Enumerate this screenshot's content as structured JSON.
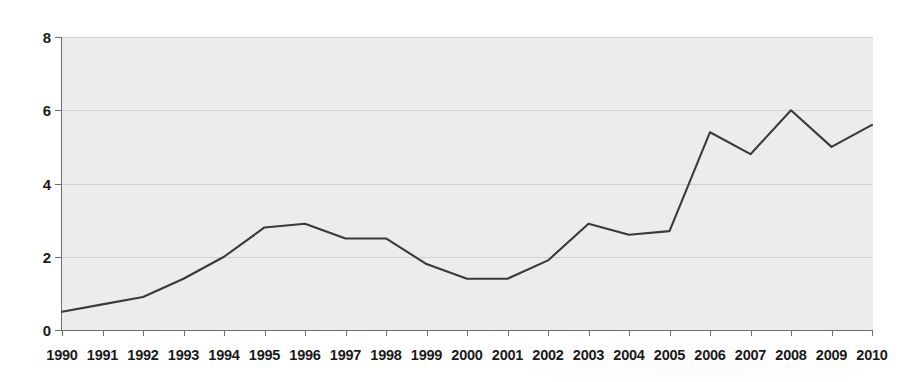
{
  "chart_data": {
    "type": "line",
    "title": "",
    "subtitle": "",
    "xlabel": "",
    "ylabel": "",
    "categories": [
      "1990",
      "1991",
      "1992",
      "1993",
      "1994",
      "1995",
      "1996",
      "1997",
      "1998",
      "1999",
      "2000",
      "2001",
      "2002",
      "2003",
      "2004",
      "2005",
      "2006",
      "2007",
      "2008",
      "2009",
      "2010"
    ],
    "values": [
      0.5,
      0.7,
      0.9,
      1.4,
      2.0,
      2.8,
      2.9,
      2.5,
      2.5,
      1.8,
      1.4,
      1.4,
      1.9,
      2.9,
      2.6,
      2.7,
      5.4,
      4.8,
      6.0,
      5.0,
      5.6
    ],
    "series": [
      {
        "name": "",
        "values": [
          0.5,
          0.7,
          0.9,
          1.4,
          2.0,
          2.8,
          2.9,
          2.5,
          2.5,
          1.8,
          1.4,
          1.4,
          1.9,
          2.9,
          2.6,
          2.7,
          5.4,
          4.8,
          6.0,
          5.0,
          5.6
        ]
      }
    ],
    "ylim": [
      0,
      8
    ],
    "y_ticks": [
      "0",
      "2",
      "4",
      "6",
      "8"
    ],
    "y_tick_values": [
      0,
      2,
      4,
      6,
      8
    ],
    "grid": true,
    "grid_axis": "y",
    "legend": "none",
    "line_color": "#3a3a3a",
    "plot_background": "#ececec",
    "gridline_color": "#d2d2d2",
    "axis_color": "#6e6e6e"
  },
  "axes": {
    "y_labels": [
      "8",
      "6",
      "4",
      "2",
      "0"
    ],
    "x_labels": [
      "1990",
      "1991",
      "1992",
      "1993",
      "1994",
      "1995",
      "1996",
      "1997",
      "1998",
      "1999",
      "2000",
      "2001",
      "2002",
      "2003",
      "2004",
      "2005",
      "2006",
      "2007",
      "2008",
      "2009",
      "2010"
    ]
  }
}
